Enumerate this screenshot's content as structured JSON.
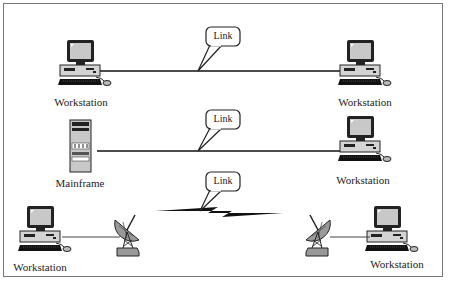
{
  "diagram": {
    "rows": [
      {
        "left_node": {
          "type": "workstation",
          "label": "Workstation"
        },
        "right_node": {
          "type": "workstation",
          "label": "Workstation"
        },
        "link": {
          "type": "cable",
          "callout": "Link"
        }
      },
      {
        "left_node": {
          "type": "mainframe",
          "label": "Mainframe"
        },
        "right_node": {
          "type": "workstation",
          "label": "Workstation"
        },
        "link": {
          "type": "cable",
          "callout": "Link"
        }
      },
      {
        "left_node": {
          "type": "workstation",
          "label": "Workstation"
        },
        "right_node": {
          "type": "workstation",
          "label": "Workstation"
        },
        "link": {
          "type": "satellite-microwave",
          "callout": "Link"
        }
      }
    ],
    "colors": {
      "frame": "#777777",
      "line": "#111111",
      "monitor_screen": "#c8c8c8",
      "case": "#d0d0d0",
      "keyboard": "#111111"
    }
  }
}
